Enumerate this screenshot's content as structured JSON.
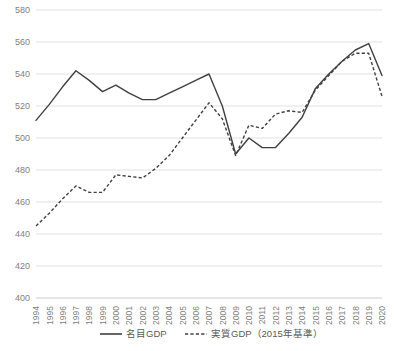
{
  "chart_data": {
    "type": "line",
    "title": "",
    "xlabel": "",
    "ylabel": "",
    "ylim": [
      400,
      580
    ],
    "ytick_step": 20,
    "yticks": [
      "400",
      "420",
      "440",
      "460",
      "480",
      "500",
      "520",
      "540",
      "560",
      "580"
    ],
    "grid": true,
    "legend_position": "bottom",
    "categories": [
      "1994",
      "1995",
      "1996",
      "1997",
      "1998",
      "1999",
      "2000",
      "2001",
      "2002",
      "2003",
      "2004",
      "2005",
      "2006",
      "2007",
      "2008",
      "2009",
      "2010",
      "2011",
      "2012",
      "2013",
      "2014",
      "2015",
      "2016",
      "2017",
      "2018",
      "2019",
      "2020"
    ],
    "series": [
      {
        "name": "名目GDP",
        "style": "solid",
        "color": "#404040",
        "values": [
          511,
          521,
          532,
          542,
          536,
          529,
          533,
          528,
          524,
          524,
          528,
          532,
          536,
          540,
          520,
          490,
          500,
          494,
          494,
          503,
          513,
          531,
          540,
          548,
          555,
          559,
          539
        ]
      },
      {
        "name": "実質GDP（2015年基準）",
        "style": "dashed",
        "color": "#404040",
        "values": [
          445,
          453,
          462,
          470,
          466,
          466,
          477,
          476,
          475,
          481,
          489,
          500,
          511,
          522,
          512,
          489,
          508,
          506,
          515,
          517,
          516,
          530,
          539,
          548,
          553,
          553,
          526
        ]
      }
    ]
  },
  "legend": {
    "items": [
      {
        "label": "名目GDP",
        "style": "solid"
      },
      {
        "label": "実質GDP（2015年基準）",
        "style": "dashed"
      }
    ]
  }
}
